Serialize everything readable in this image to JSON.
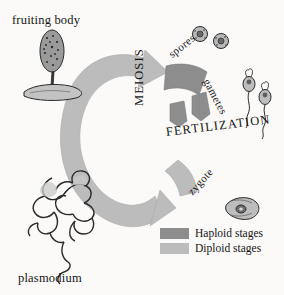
{
  "figure": {
    "background_color": "#fbfaf8"
  },
  "colors": {
    "haploid": "#8d8d8d",
    "diploid": "#bcbcbc",
    "ink": "#141414",
    "cell_fill": "#cfcfcf"
  },
  "organism_labels": {
    "fruiting_body": "fruiting body",
    "plasmodium": "plasmodium"
  },
  "process_labels": {
    "meiosis": "MEIOSIS",
    "fertilization": "FERTILIZATION"
  },
  "stage_labels": {
    "spores": "spores",
    "gametes": "gametes",
    "zygote": "zygote"
  },
  "legend": {
    "items": [
      {
        "label": "Haploid stages",
        "color": "#8d8d8d",
        "swatch_name": "haploid-swatch"
      },
      {
        "label": "Diploid stages",
        "color": "#bcbcbc",
        "swatch_name": "diploid-swatch"
      }
    ]
  },
  "cells": {
    "spore_count": 2,
    "gamete_count": 2,
    "zygote_count": 1
  }
}
